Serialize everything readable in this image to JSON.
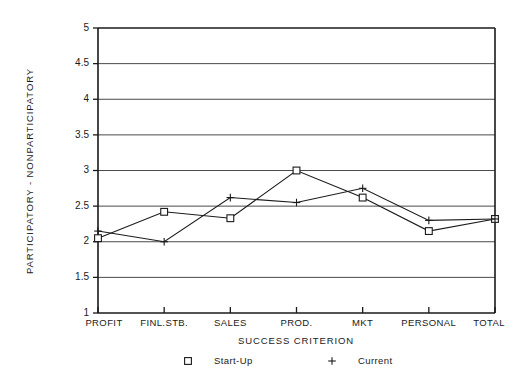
{
  "chart_data": {
    "type": "line",
    "title": "",
    "xlabel": "SUCCESS CRITERION",
    "ylabel": "PARTICIPATORY - NONPARTICIPATORY",
    "categories": [
      "PROFIT",
      "FINL.STB.",
      "SALES",
      "PROD.",
      "MKT",
      "PERSONAL",
      "TOTAL"
    ],
    "series": [
      {
        "name": "Start-Up",
        "marker": "square",
        "values": [
          2.05,
          2.42,
          2.33,
          3.0,
          2.62,
          2.15,
          2.32
        ]
      },
      {
        "name": "Current",
        "marker": "plus",
        "values": [
          2.15,
          2.0,
          2.62,
          2.55,
          2.75,
          2.3,
          2.32
        ]
      }
    ],
    "ylim": [
      1,
      5
    ],
    "yticks": [
      1,
      1.5,
      2,
      2.5,
      3,
      3.5,
      4,
      4.5,
      5
    ],
    "ytick_labels": [
      "1",
      "1.5",
      "2",
      "2.5",
      "3",
      "3.5",
      "4",
      "4.5",
      "5"
    ],
    "grid": true,
    "grid_axis": "y",
    "legend_position": "below",
    "line_color": "#1a1a1a",
    "grid_color": "#4a4a4a"
  },
  "legend": {
    "entries": [
      {
        "label": "Start-Up",
        "marker_name": "square-marker-icon"
      },
      {
        "label": "Current",
        "marker_name": "plus-marker-icon"
      }
    ]
  }
}
